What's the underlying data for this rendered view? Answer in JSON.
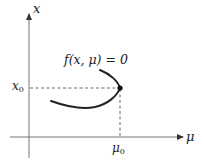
{
  "diagram": {
    "axes": {
      "vertical_label": "x",
      "horizontal_label": "μ",
      "color": "#777777"
    },
    "curve": {
      "label": "f(x, μ) = 0",
      "color": "#222222"
    },
    "point": {
      "x_label_base": "x",
      "x_label_sub": "0",
      "mu_label_base": "μ",
      "mu_label_sub": "0"
    },
    "guide_lines": {
      "style": "dashed",
      "color": "#555555"
    }
  }
}
